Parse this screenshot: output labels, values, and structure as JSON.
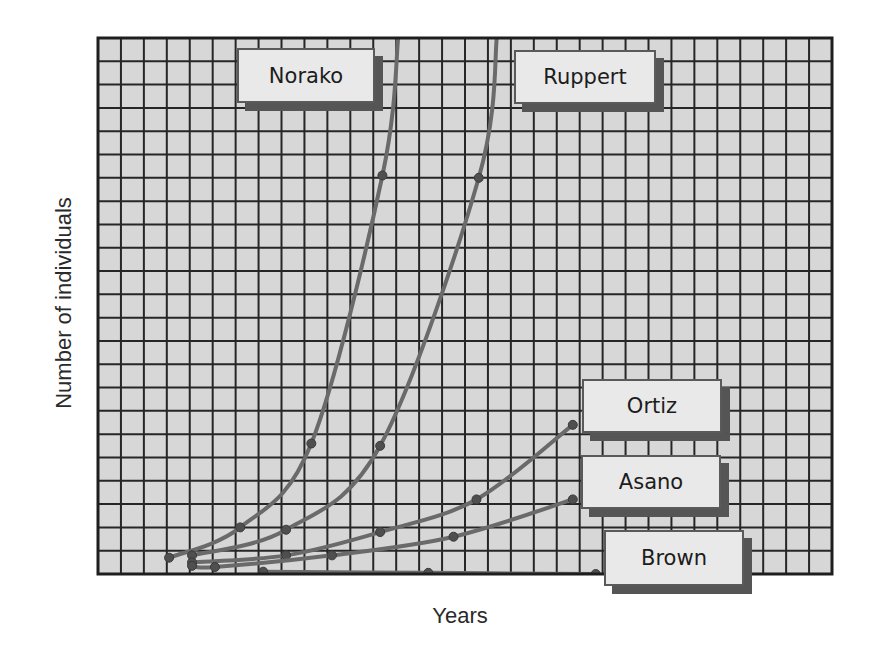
{
  "chart_data": {
    "type": "line",
    "title": "",
    "xlabel": "Years",
    "ylabel": "Number of individuals",
    "grid": true,
    "grid_columns": 32,
    "grid_rows": 23,
    "x_ticks": [],
    "y_ticks": [],
    "units_note": "No numeric tick labels are shown; values are in grid-cell units (x: columns from left edge, y: rows from bottom edge).",
    "xlim": [
      0,
      32
    ],
    "ylim": [
      0,
      23
    ],
    "legend_position": "inline labels next to curves",
    "series": [
      {
        "name": "Norako",
        "points": [
          [
            3.1,
            0.7
          ],
          [
            6.2,
            2.0
          ],
          [
            9.3,
            5.6
          ],
          [
            12.4,
            17.1
          ]
        ],
        "curve_to_top": [
          13.1,
          23
        ],
        "label_box": {
          "x": 237,
          "y": 48,
          "w": 138,
          "h": 55
        }
      },
      {
        "name": "Ruppert",
        "points": [
          [
            4.1,
            0.8
          ],
          [
            8.2,
            1.9
          ],
          [
            12.3,
            5.5
          ],
          [
            16.6,
            17.0
          ]
        ],
        "curve_to_top": [
          17.4,
          23
        ],
        "label_box": {
          "x": 514,
          "y": 50,
          "w": 142,
          "h": 54
        }
      },
      {
        "name": "Ortiz",
        "points": [
          [
            4.1,
            0.5
          ],
          [
            8.2,
            0.8
          ],
          [
            12.3,
            1.8
          ],
          [
            16.5,
            3.2
          ],
          [
            20.7,
            6.4
          ]
        ],
        "label_box": {
          "x": 582,
          "y": 379,
          "w": 140,
          "h": 54
        }
      },
      {
        "name": "Asano",
        "points": [
          [
            4.1,
            0.35
          ],
          [
            5.1,
            0.3
          ],
          [
            10.2,
            0.8
          ],
          [
            15.5,
            1.6
          ],
          [
            20.7,
            3.2
          ]
        ],
        "label_box": {
          "x": 581,
          "y": 455,
          "w": 140,
          "h": 54
        }
      },
      {
        "name": "Brown",
        "points": [
          [
            7.2,
            0.1
          ],
          [
            14.4,
            0.05
          ],
          [
            21.7,
            0.0
          ]
        ],
        "label_box": {
          "x": 604,
          "y": 530,
          "w": 140,
          "h": 56
        }
      }
    ]
  },
  "colors": {
    "grid_background": "#d7d7d7",
    "grid_line": "#262626",
    "curve": "#6a6a6a",
    "marker": "#4f4f4f",
    "label_fill": "#e9e9e9",
    "label_shadow": "#555555"
  },
  "axes": {
    "x_label": "Years",
    "y_label": "Number of individuals"
  }
}
